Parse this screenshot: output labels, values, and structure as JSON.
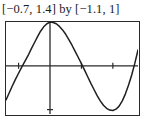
{
  "caption": {
    "text": "[−0.7, 1.4] by [−1.1, 1]",
    "x_range_label": "[−0.7, 1.4]",
    "connector": "by",
    "y_range_label": "[−1.1, 1]"
  },
  "colors": {
    "background": "#ffffff",
    "frame": "#2a2a2a",
    "axis": "#2a2a2a",
    "curve": "#1f1f1f",
    "text": "#1b1b1b"
  },
  "chart_data": {
    "type": "line",
    "title": "[−0.7, 1.4] by [−1.1, 1]",
    "xlabel": "",
    "ylabel": "",
    "xlim": [
      -0.7,
      1.4
    ],
    "ylim": [
      -1.1,
      1
    ],
    "grid": false,
    "legend": null,
    "axes": {
      "x_axis_at_y": 0,
      "y_axis_at_x": 0,
      "x_ticks": [
        -0.5,
        0.5,
        1.0
      ],
      "y_ticks": [
        -1.0
      ],
      "tick_labels_shown": false
    },
    "series": [
      {
        "name": "curve",
        "x": [
          -0.7,
          -0.65,
          -0.6,
          -0.55,
          -0.5,
          -0.45,
          -0.4,
          -0.35,
          -0.3,
          -0.25,
          -0.2,
          -0.15,
          -0.1,
          -0.05,
          0.0,
          0.05,
          0.1,
          0.15,
          0.2,
          0.25,
          0.3,
          0.35,
          0.4,
          0.45,
          0.5,
          0.55,
          0.6,
          0.65,
          0.7,
          0.75,
          0.8,
          0.85,
          0.9,
          0.95,
          1.0,
          1.05,
          1.1,
          1.15,
          1.2,
          1.25,
          1.3,
          1.35,
          1.4
        ],
        "y": [
          -0.78,
          -0.62,
          -0.46,
          -0.31,
          -0.17,
          -0.03,
          0.1,
          0.23,
          0.38,
          0.52,
          0.66,
          0.79,
          0.89,
          0.96,
          1.0,
          0.99,
          0.96,
          0.9,
          0.82,
          0.72,
          0.6,
          0.47,
          0.33,
          0.19,
          0.05,
          -0.1,
          -0.25,
          -0.4,
          -0.54,
          -0.68,
          -0.8,
          -0.9,
          -0.97,
          -1.01,
          -1.02,
          -0.99,
          -0.92,
          -0.8,
          -0.64,
          -0.44,
          -0.21,
          0.06,
          0.36
        ]
      }
    ],
    "annotations": {
      "peak": {
        "x": 0.0,
        "y": 1.0
      },
      "trough": {
        "x": 1.0,
        "y": -1.02
      },
      "zero_crossings": [
        -0.46,
        0.52
      ]
    }
  }
}
